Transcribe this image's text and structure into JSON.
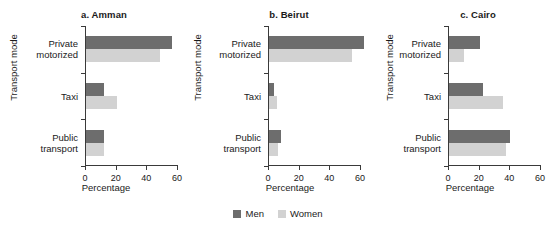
{
  "figure": {
    "shared_ylabel": "Transport mode",
    "shared_xlabel": "Percentage",
    "categories": [
      "Private motorized",
      "Taxi",
      "Public transport"
    ],
    "category_lines": [
      [
        "Private",
        "motorized"
      ],
      [
        "Taxi",
        ""
      ],
      [
        "Public",
        "transport"
      ]
    ],
    "xticks": [
      "0",
      "20",
      "40",
      "60"
    ]
  },
  "legend": {
    "position": "bottom-center",
    "items": [
      {
        "label": "Men",
        "color": "#6d6d6d"
      },
      {
        "label": "Women",
        "color": "#d2d2d2"
      }
    ]
  },
  "chart_data": [
    {
      "type": "bar",
      "orientation": "horizontal",
      "title": "a. Amman",
      "xlabel": "Percentage",
      "ylabel": "Transport mode",
      "categories": [
        "Private motorized",
        "Taxi",
        "Public transport"
      ],
      "series": [
        {
          "name": "Men",
          "color": "#6d6d6d",
          "values": [
            56,
            12,
            12
          ]
        },
        {
          "name": "Women",
          "color": "#d2d2d2",
          "values": [
            48,
            20,
            12
          ]
        }
      ],
      "xlim": [
        0,
        60
      ],
      "xticks": [
        0,
        20,
        40,
        60
      ],
      "grid": false
    },
    {
      "type": "bar",
      "orientation": "horizontal",
      "title": "b. Beirut",
      "xlabel": "Percentage",
      "ylabel": "Transport mode",
      "categories": [
        "Private motorized",
        "Taxi",
        "Public transport"
      ],
      "series": [
        {
          "name": "Men",
          "color": "#6d6d6d",
          "values": [
            62,
            3,
            8
          ]
        },
        {
          "name": "Women",
          "color": "#d2d2d2",
          "values": [
            54,
            5,
            6
          ]
        }
      ],
      "xlim": [
        0,
        60
      ],
      "xticks": [
        0,
        20,
        40,
        60
      ],
      "grid": false
    },
    {
      "type": "bar",
      "orientation": "horizontal",
      "title": "c. Cairo",
      "xlabel": "Percentage",
      "ylabel": "Transport mode",
      "categories": [
        "Private motorized",
        "Taxi",
        "Public transport"
      ],
      "series": [
        {
          "name": "Men",
          "color": "#6d6d6d",
          "values": [
            20,
            22,
            40
          ]
        },
        {
          "name": "Women",
          "color": "#d2d2d2",
          "values": [
            10,
            35,
            37
          ]
        }
      ],
      "xlim": [
        0,
        60
      ],
      "xticks": [
        0,
        20,
        40,
        60
      ],
      "grid": false
    }
  ]
}
